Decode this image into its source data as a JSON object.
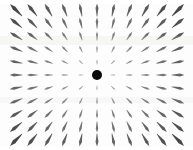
{
  "figure": {
    "title": "",
    "background_color": "#fdfdfd",
    "width": 193,
    "height": 150
  },
  "chart_data": {
    "type": "scatter",
    "plot_style": "quiver",
    "title": "",
    "subtitle": "",
    "xlabel": "",
    "ylabel": "",
    "xlim": [
      -5,
      5
    ],
    "ylim": [
      -5,
      5
    ],
    "grid": false,
    "legend": null,
    "axes_visible": false,
    "ticks_visible": false,
    "frame_visible": false,
    "grid_columns": 11,
    "grid_rows": 11,
    "center_px": [
      97,
      75
    ],
    "spacing_px": [
      16.2,
      13.0
    ],
    "arrow_color": "#3c3c3c",
    "arrow_direction": "outward-radial",
    "magnitude_rule": "proportional-to-radius",
    "min_arrow_length_px": 3,
    "max_arrow_length_px": 17,
    "center_marker": {
      "label": "point source",
      "shape": "circle",
      "color": "#0a0a0a",
      "diameter_px": 10,
      "x": 0,
      "y": 0
    },
    "x": [
      -5,
      -4,
      -3,
      -2,
      -1,
      0,
      1,
      2,
      3,
      4,
      5
    ],
    "y": [
      5,
      4,
      3,
      2,
      1,
      0,
      -1,
      -2,
      -3,
      -4,
      -5
    ],
    "series": [
      {
        "name": "vector field",
        "u_rule": "u = x",
        "v_rule": "v = y",
        "color": "#3c3c3c"
      }
    ]
  },
  "annotations": []
}
